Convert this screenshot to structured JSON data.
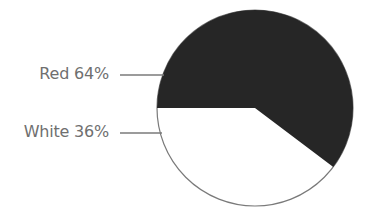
{
  "chart_data": {
    "type": "pie",
    "title": "",
    "categories": [
      "Red",
      "White"
    ],
    "values": [
      64,
      36
    ],
    "unit": "%",
    "labels": [
      "Red 64%",
      "White 36%"
    ],
    "colors": [
      "#262626",
      "#ffffff"
    ],
    "outline_color": "#7a7a7a",
    "label_color": "#6f6f6f",
    "legend_position": "left, with leader lines"
  },
  "labels": {
    "red": "Red 64%",
    "white": "White 36%"
  }
}
